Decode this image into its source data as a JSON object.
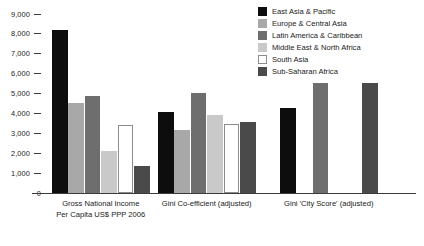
{
  "chart_data": {
    "type": "bar",
    "title": "",
    "xlabel": "",
    "ylabel": "",
    "ylim": [
      0,
      9000
    ],
    "grid": false,
    "legend_position": "top-right",
    "categories": [
      "Gross National Income\nPer Capita US$ PPP 2006",
      "Gini Co-efficient (adjusted)",
      "Gini 'City Score' (adjusted)"
    ],
    "category_lines": [
      [
        "Gross National Income",
        "Per Capita US$ PPP 2006"
      ],
      [
        "Gini Co-efficient (adjusted)"
      ],
      [
        "Gini 'City Score' (adjusted)"
      ]
    ],
    "yticks": [
      9000,
      8000,
      7000,
      6000,
      5000,
      4000,
      3000,
      2000,
      1000,
      0
    ],
    "ytick_labels": [
      "9,000",
      "8,000",
      "7,000",
      "6,000",
      "5,000",
      "4,000",
      "3,000",
      "2,000",
      "1,000",
      "0"
    ],
    "series": [
      {
        "name": "East Asia & Pacific",
        "color": "#0d0d0d",
        "values": [
          8200,
          4050,
          4250
        ]
      },
      {
        "name": "Europe & Central Asia",
        "color": "#a8a8a8",
        "values": [
          4550,
          3150,
          null
        ]
      },
      {
        "name": "Latin America & Caribbean",
        "color": "#6e6e6e",
        "values": [
          4900,
          5050,
          5550
        ]
      },
      {
        "name": "Middle East & North Africa",
        "color": "#c9c9c9",
        "values": [
          2100,
          3900,
          null
        ]
      },
      {
        "name": "South Asia",
        "color": "#ffffff",
        "values": [
          3400,
          3450,
          null
        ]
      },
      {
        "name": "Sub-Saharan Africa",
        "color": "#4a4a4a",
        "values": [
          1350,
          3550,
          5550
        ]
      }
    ]
  },
  "legend": {
    "items": [
      {
        "label": "East Asia & Pacific"
      },
      {
        "label": "Europe & Central Asia"
      },
      {
        "label": "Latin America & Caribbean"
      },
      {
        "label": "Middle East & North Africa"
      },
      {
        "label": "South Asia"
      },
      {
        "label": "Sub-Saharan Africa"
      }
    ]
  }
}
